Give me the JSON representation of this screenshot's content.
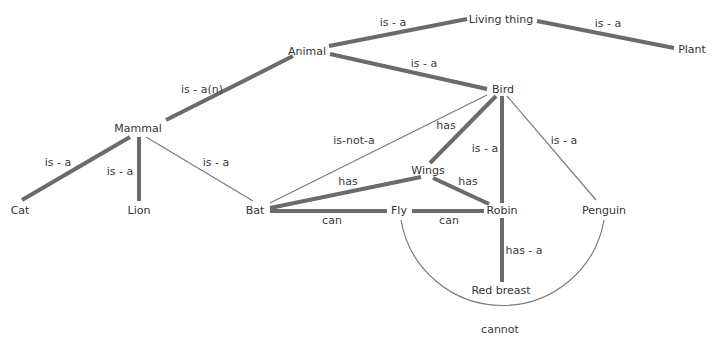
{
  "diagram": {
    "type": "semantic-network",
    "nodes": {
      "living_thing": "Living thing",
      "plant": "Plant",
      "animal": "Animal",
      "bird": "Bird",
      "mammal": "Mammal",
      "cat": "Cat",
      "lion": "Lion",
      "bat": "Bat",
      "wings": "Wings",
      "fly": "Fly",
      "robin": "Robin",
      "penguin": "Penguin",
      "red_breast": "Red breast"
    },
    "edges": [
      {
        "from": "Animal",
        "to": "Living thing",
        "label": "is - a",
        "weight": "thick"
      },
      {
        "from": "Plant",
        "to": "Living thing",
        "label": "is - a",
        "weight": "thick"
      },
      {
        "from": "Mammal",
        "to": "Animal",
        "label": "is - a(n)",
        "weight": "thick"
      },
      {
        "from": "Bird",
        "to": "Animal",
        "label": "is - a",
        "weight": "thick"
      },
      {
        "from": "Cat",
        "to": "Mammal",
        "label": "is - a",
        "weight": "thick"
      },
      {
        "from": "Lion",
        "to": "Mammal",
        "label": "is - a",
        "weight": "thick"
      },
      {
        "from": "Bat",
        "to": "Mammal",
        "label": "is - a",
        "weight": "thin"
      },
      {
        "from": "Bat",
        "to": "Bird",
        "label": "is-not-a",
        "weight": "thin"
      },
      {
        "from": "Bird",
        "to": "Wings",
        "label": "has",
        "weight": "thick"
      },
      {
        "from": "Robin",
        "to": "Bird",
        "label": "is - a",
        "weight": "thick"
      },
      {
        "from": "Penguin",
        "to": "Bird",
        "label": "is - a",
        "weight": "thin"
      },
      {
        "from": "Bat",
        "to": "Wings",
        "label": "has",
        "weight": "thick"
      },
      {
        "from": "Robin",
        "to": "Wings",
        "label": "has",
        "weight": "thick"
      },
      {
        "from": "Bat",
        "to": "Fly",
        "label": "can",
        "weight": "thick"
      },
      {
        "from": "Robin",
        "to": "Fly",
        "label": "can",
        "weight": "thick"
      },
      {
        "from": "Robin",
        "to": "Red breast",
        "label": "has - a",
        "weight": "thick"
      },
      {
        "from": "Penguin",
        "to": "Fly",
        "label": "cannot",
        "weight": "thin"
      }
    ],
    "edge_labels": {
      "animal_living": "is - a",
      "plant_living": "is - a",
      "mammal_animal": "is - a(n)",
      "bird_animal": "is - a",
      "cat_mammal": "is - a",
      "lion_mammal": "is - a",
      "bat_mammal": "is - a",
      "bat_bird": "is-not-a",
      "bird_wings": "has",
      "robin_bird": "is - a",
      "penguin_bird": "is - a",
      "bat_wings": "has",
      "robin_wings": "has",
      "bat_fly": "can",
      "robin_fly": "can",
      "robin_redbreast": "has - a",
      "penguin_fly": "cannot"
    },
    "colors": {
      "thick_edge": "#6b6b6b",
      "thin_edge": "#7a7a7a",
      "text": "#333333",
      "background": "#ffffff"
    }
  }
}
